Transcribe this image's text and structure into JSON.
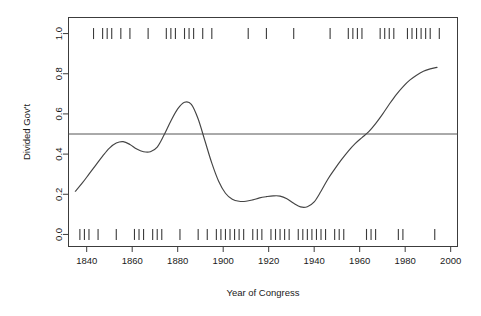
{
  "figure": {
    "width": 481,
    "height": 316,
    "background": "#ffffff"
  },
  "axes": {
    "x_title": "Year of Congress",
    "y_title": "Divided Gov't",
    "x_ticks": [
      1840,
      1860,
      1880,
      1900,
      1920,
      1940,
      1960,
      1980,
      2000
    ],
    "x_tick_labels": [
      "1840",
      "1860",
      "1880",
      "1900",
      "1920",
      "1940",
      "1960",
      "1980",
      "2000"
    ],
    "y_ticks": [
      0.0,
      0.2,
      0.4,
      0.6,
      0.8,
      1.0
    ],
    "y_tick_labels": [
      "0.0",
      "0.2",
      "0.4",
      "0.6",
      "0.8",
      "1.0"
    ],
    "xlim": [
      1832,
      2003
    ],
    "ylim": [
      -0.06,
      1.08
    ],
    "frame": "box",
    "grid": false
  },
  "colors": {
    "curve": "#444444",
    "frame": "#3c3c3c",
    "reference_line": "#555555",
    "rug": "#3a3a3a",
    "text": "#1a1a1a"
  },
  "chart_data": {
    "type": "line",
    "title": "",
    "subtitle": "",
    "xlabel": "Year of Congress",
    "ylabel": "Divided Gov't",
    "xlim": [
      1832,
      2003
    ],
    "ylim": [
      -0.06,
      1.08
    ],
    "grid": false,
    "legend": "none",
    "annotations": [
      {
        "kind": "horizontal-reference-line",
        "y": 0.5,
        "label": "0.5 probability reference"
      }
    ],
    "series": [
      {
        "name": "Smoothed probability of divided government",
        "x": [
          1835,
          1838,
          1841,
          1844,
          1847,
          1850,
          1853,
          1856,
          1859,
          1862,
          1865,
          1868,
          1871,
          1874,
          1877,
          1880,
          1883,
          1886,
          1889,
          1892,
          1895,
          1898,
          1901,
          1904,
          1907,
          1910,
          1913,
          1916,
          1919,
          1922,
          1925,
          1928,
          1931,
          1934,
          1937,
          1940,
          1943,
          1946,
          1949,
          1952,
          1955,
          1958,
          1961,
          1964,
          1967,
          1970,
          1973,
          1976,
          1979,
          1982,
          1985,
          1988,
          1991,
          1994
        ],
        "y": [
          0.215,
          0.255,
          0.3,
          0.345,
          0.39,
          0.43,
          0.455,
          0.462,
          0.448,
          0.425,
          0.412,
          0.412,
          0.435,
          0.495,
          0.565,
          0.625,
          0.658,
          0.648,
          0.575,
          0.465,
          0.355,
          0.265,
          0.205,
          0.175,
          0.165,
          0.165,
          0.172,
          0.182,
          0.188,
          0.192,
          0.191,
          0.178,
          0.155,
          0.137,
          0.138,
          0.162,
          0.215,
          0.275,
          0.325,
          0.372,
          0.415,
          0.452,
          0.482,
          0.512,
          0.552,
          0.598,
          0.648,
          0.695,
          0.735,
          0.768,
          0.793,
          0.812,
          0.824,
          0.832
        ]
      }
    ],
    "rug_top": {
      "description": "Congresses with divided government (value = 1)",
      "y_value": 1.0,
      "x": [
        1843,
        1847,
        1849,
        1851,
        1855,
        1859,
        1867,
        1875,
        1877,
        1879,
        1883,
        1885,
        1887,
        1891,
        1895,
        1911,
        1919,
        1931,
        1947,
        1955,
        1957,
        1959,
        1961,
        1969,
        1971,
        1973,
        1975,
        1981,
        1983,
        1985,
        1987,
        1989,
        1991,
        1995
      ]
    },
    "rug_bottom": {
      "description": "Congresses with unified government (value = 0)",
      "y_value": 0.0,
      "x": [
        1837,
        1839,
        1841,
        1845,
        1853,
        1861,
        1863,
        1865,
        1869,
        1871,
        1873,
        1881,
        1889,
        1893,
        1897,
        1899,
        1901,
        1903,
        1905,
        1907,
        1909,
        1913,
        1915,
        1917,
        1921,
        1923,
        1925,
        1927,
        1929,
        1933,
        1935,
        1937,
        1939,
        1941,
        1943,
        1945,
        1949,
        1951,
        1953,
        1963,
        1965,
        1967,
        1977,
        1979,
        1993
      ]
    }
  }
}
